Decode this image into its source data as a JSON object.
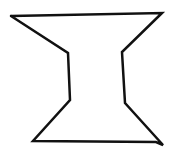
{
  "figure": {
    "title": "Hand-drawn hourglass / spool shape",
    "stroke_color": "#111111",
    "background": "#ffffff",
    "stroke_width": 2.5,
    "shape": {
      "name": "hourglass-outline",
      "points": [
        [
          11,
          16
        ],
        [
          162,
          13
        ],
        [
          122,
          52
        ],
        [
          125,
          103
        ],
        [
          163,
          145
        ],
        [
          156,
          142
        ],
        [
          33,
          141
        ],
        [
          70,
          100
        ],
        [
          68,
          53
        ],
        [
          11,
          16
        ]
      ]
    }
  }
}
